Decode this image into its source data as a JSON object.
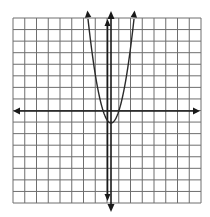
{
  "chart_data": {
    "type": "line",
    "title": "",
    "xlabel": "",
    "ylabel": "",
    "grid": true,
    "grid_size": {
      "columns": 16,
      "rows": 16
    },
    "xlim": [
      -8,
      8
    ],
    "ylim": [
      -8,
      8
    ],
    "axes": {
      "x_axis_arrows": true,
      "y_axis_arrows": true
    },
    "series": [
      {
        "name": "parabola",
        "equation": "y = 2x^2 - 1",
        "vertex": [
          0,
          -1
        ],
        "x_intercepts": [
          -0.71,
          0.71
        ],
        "x": [
          -2,
          -1.5,
          -1,
          -0.5,
          0,
          0.5,
          1,
          1.5,
          2
        ],
        "y": [
          7,
          3.5,
          1,
          -0.5,
          -1,
          -0.5,
          1,
          3.5,
          7
        ],
        "arrows_at_ends": true
      },
      {
        "name": "vertical line",
        "equation": "x ≈ -0.3",
        "x": [
          -0.3,
          -0.3
        ],
        "y": [
          -7.5,
          7.7
        ],
        "arrows_at_ends": true
      }
    ],
    "colors": {
      "grid": "#6e6e6e",
      "axes": "#1a1a1a",
      "curve": "#2a2a2a",
      "background": "#ffffff"
    }
  }
}
